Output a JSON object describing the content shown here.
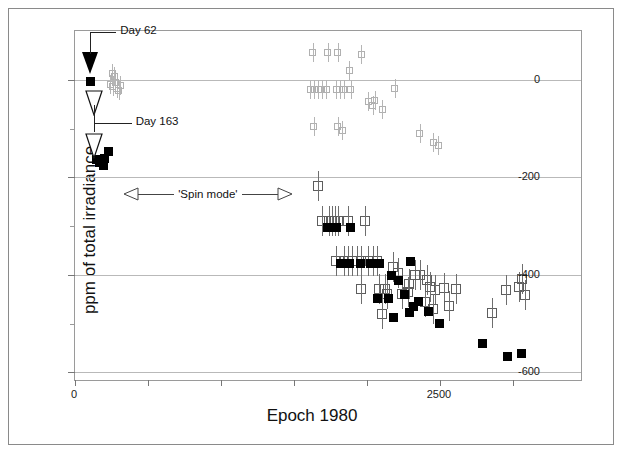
{
  "chart_data": {
    "type": "scatter",
    "title": "",
    "xlabel": "Epoch 1980",
    "ylabel": "ppm of total irradiance",
    "xlim": [
      0,
      3480
    ],
    "ylim": [
      -620,
      100
    ],
    "xticks_major": [
      0,
      2500
    ],
    "xtick_labels": [
      "0",
      "2500"
    ],
    "xticks_all": [
      0,
      500,
      1000,
      1500,
      2000,
      2500,
      3000
    ],
    "yticks_major": [
      0,
      -200,
      -400,
      -600
    ],
    "ytick_labels": [
      "0",
      "-200",
      "-400",
      "-600"
    ],
    "yticks_minor": [
      -100,
      -300,
      -500
    ],
    "grid": "horizontal-major",
    "legend": "none",
    "marker_colors": {
      "filled": "#000000",
      "open": "#5d5d5d",
      "faint": "#b0b0b0"
    },
    "series": [
      {
        "name": "open-squares-faint",
        "marker": "open-square-faint",
        "points": [
          [
            240,
            -10
          ],
          [
            260,
            -14
          ],
          [
            275,
            -6
          ],
          [
            285,
            -18
          ],
          [
            300,
            -22
          ],
          [
            310,
            -12
          ],
          [
            255,
            12
          ],
          [
            270,
            6
          ],
          [
            1630,
            55
          ],
          [
            1730,
            55
          ],
          [
            1800,
            55
          ],
          [
            1960,
            52
          ],
          [
            1880,
            20
          ],
          [
            1610,
            -20
          ],
          [
            1640,
            -20
          ],
          [
            1665,
            -20
          ],
          [
            1690,
            -20
          ],
          [
            1720,
            -20
          ],
          [
            1790,
            -20
          ],
          [
            1815,
            -20
          ],
          [
            1840,
            -20
          ],
          [
            1890,
            -20
          ],
          [
            2190,
            -18
          ],
          [
            2010,
            -45
          ],
          [
            2040,
            -52
          ],
          [
            2055,
            -42
          ],
          [
            2105,
            -60
          ],
          [
            1635,
            -95
          ],
          [
            1800,
            -95
          ],
          [
            1830,
            -105
          ],
          [
            2360,
            -110
          ],
          [
            2455,
            -128
          ],
          [
            2490,
            -135
          ]
        ]
      },
      {
        "name": "open-squares",
        "marker": "open-square",
        "points": [
          [
            1665,
            -218
          ],
          [
            1690,
            -290
          ],
          [
            1740,
            -290
          ],
          [
            1760,
            -290
          ],
          [
            1780,
            -290
          ],
          [
            1800,
            -290
          ],
          [
            1870,
            -290
          ],
          [
            1990,
            -290
          ],
          [
            1790,
            -372
          ],
          [
            1840,
            -372
          ],
          [
            1870,
            -372
          ],
          [
            1900,
            -372
          ],
          [
            1930,
            -372
          ],
          [
            1960,
            -372
          ],
          [
            2010,
            -372
          ],
          [
            2040,
            -372
          ],
          [
            2070,
            -372
          ],
          [
            2175,
            -385
          ],
          [
            2215,
            -397
          ],
          [
            2330,
            -400
          ],
          [
            2290,
            -418
          ],
          [
            2365,
            -400
          ],
          [
            2410,
            -410
          ],
          [
            1960,
            -430
          ],
          [
            2080,
            -430
          ],
          [
            2125,
            -430
          ],
          [
            2140,
            -440
          ],
          [
            2240,
            -440
          ],
          [
            2280,
            -435
          ],
          [
            2465,
            -432
          ],
          [
            2530,
            -428
          ],
          [
            2610,
            -430
          ],
          [
            2950,
            -432
          ],
          [
            3040,
            -425
          ],
          [
            3080,
            -442
          ],
          [
            2105,
            -480
          ],
          [
            2395,
            -455
          ],
          [
            2450,
            -470
          ],
          [
            2560,
            -465
          ],
          [
            2860,
            -478
          ],
          [
            2430,
            -425
          ],
          [
            3060,
            -408
          ]
        ]
      },
      {
        "name": "filled-squares",
        "marker": "filled-square",
        "points": [
          [
            105,
            -3
          ],
          [
            150,
            -163
          ],
          [
            165,
            -170
          ],
          [
            178,
            -168
          ],
          [
            192,
            -175
          ],
          [
            205,
            -162
          ],
          [
            228,
            -148
          ],
          [
            1730,
            -303
          ],
          [
            1760,
            -303
          ],
          [
            1790,
            -303
          ],
          [
            1885,
            -303
          ],
          [
            1820,
            -377
          ],
          [
            1850,
            -377
          ],
          [
            1880,
            -377
          ],
          [
            1955,
            -377
          ],
          [
            2025,
            -377
          ],
          [
            2055,
            -377
          ],
          [
            2085,
            -377
          ],
          [
            2170,
            -402
          ],
          [
            2300,
            -372
          ],
          [
            2215,
            -412
          ],
          [
            2070,
            -448
          ],
          [
            2150,
            -448
          ],
          [
            2255,
            -440
          ],
          [
            2350,
            -455
          ],
          [
            2320,
            -465
          ],
          [
            2290,
            -478
          ],
          [
            2180,
            -488
          ],
          [
            2420,
            -475
          ],
          [
            2500,
            -500
          ],
          [
            2790,
            -540
          ],
          [
            2960,
            -568
          ],
          [
            3060,
            -562
          ]
        ]
      }
    ],
    "annotations": [
      {
        "name": "day-62",
        "label": "Day 62",
        "marker": "filled-down-triangle",
        "x": 105,
        "y": 40
      },
      {
        "name": "day-163",
        "label": "Day 163",
        "marker": "open-down-triangle",
        "x": 128,
        "y": -60
      },
      {
        "name": "spin-mode",
        "label": "'Spin mode'",
        "marker": "double-arrow",
        "x_from": 330,
        "x_to": 1490,
        "y": -235
      }
    ]
  },
  "axis": {
    "y_title": "ppm of total irradiance",
    "x_title": "Epoch 1980",
    "y_labels": [
      "0",
      "-200",
      "-400",
      "-600"
    ],
    "x_labels": [
      "0",
      "2500"
    ]
  },
  "annotations": {
    "day62": "Day 62",
    "day163": "Day 163",
    "spin_mode": "'Spin mode'"
  }
}
